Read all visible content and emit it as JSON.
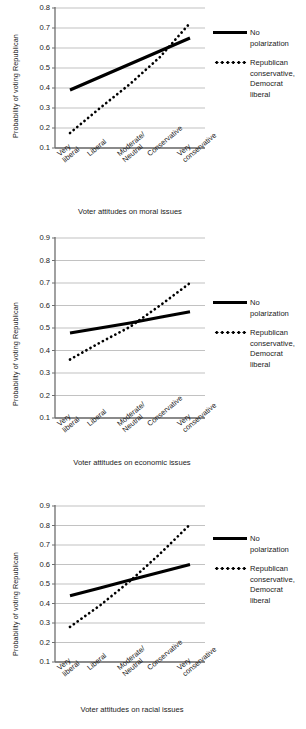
{
  "figure": {
    "series_names": {
      "solid": "No polarization",
      "dotted": "Republican conservative, Democrat liberal"
    },
    "legend": {
      "solid_label": "No polarization",
      "dotted_label": "Republican\nconservative,\nDemocrat\nliberal",
      "solid_key_icon": "solid-line-key-icon",
      "dotted_key_icon": "dotted-line-key-icon"
    },
    "shared": {
      "ylabel": "Probability of voting Republican",
      "categories": [
        "Very\nliberal",
        "Liberal",
        "Moderate/\nNeutral",
        "Conservative",
        "Very\nconservative"
      ]
    },
    "colors": {
      "line": "#000000",
      "grid": "#a8a8a8",
      "axis": "#808080",
      "text": "#1a1a1a",
      "background": "#ffffff"
    }
  },
  "chart_data": [
    {
      "id": "moral-issues",
      "type": "line",
      "title": "",
      "xlabel": "Voter attitudes on moral issues",
      "ylabel": "Probability of voting Republican",
      "categories": [
        "Very liberal",
        "Liberal",
        "Moderate/Neutral",
        "Conservative",
        "Very conservative"
      ],
      "yticks": [
        0.1,
        0.2,
        0.3,
        0.4,
        0.5,
        0.6,
        0.7,
        0.8
      ],
      "ytick_labels": [
        "0.1",
        "0.2",
        "0.3",
        "0.4",
        "0.5",
        "0.6",
        "0.7",
        "0.8"
      ],
      "ylim": [
        0.1,
        0.8
      ],
      "grid": true,
      "legend_position": "right",
      "series": [
        {
          "name": "No polarization",
          "style": "solid",
          "values": [
            0.39,
            0.455,
            0.52,
            0.585,
            0.65
          ]
        },
        {
          "name": "Republican conservative, Democrat liberal",
          "style": "dotted",
          "values": [
            0.175,
            0.3,
            0.42,
            0.555,
            0.725
          ]
        }
      ]
    },
    {
      "id": "economic-issues",
      "type": "line",
      "title": "",
      "xlabel": "Voter attitudes on economic issues",
      "ylabel": "Probability of voting Republican",
      "categories": [
        "Very liberal",
        "Liberal",
        "Moderate/Neutral",
        "Conservative",
        "Very conservative"
      ],
      "yticks": [
        0.1,
        0.2,
        0.3,
        0.4,
        0.5,
        0.6,
        0.7,
        0.8,
        0.9
      ],
      "ytick_labels": [
        "0.1",
        "0.2",
        "0.3",
        "0.4",
        "0.5",
        "0.6",
        "0.7",
        "0.8",
        "0.9"
      ],
      "ylim": [
        0.1,
        0.9
      ],
      "grid": true,
      "legend_position": "right",
      "series": [
        {
          "name": "No polarization",
          "style": "solid",
          "values": [
            0.478,
            0.5,
            0.5225,
            0.5475,
            0.572
          ]
        },
        {
          "name": "Republican conservative, Democrat liberal",
          "style": "dotted",
          "values": [
            0.36,
            0.435,
            0.505,
            0.6,
            0.7
          ]
        }
      ]
    },
    {
      "id": "racial-issues",
      "type": "line",
      "title": "",
      "xlabel": "Voter attitudes on racial issues",
      "ylabel": "Probability of voting Republican",
      "categories": [
        "Very liberal",
        "Liberal",
        "Moderate/Neutral",
        "Conservative",
        "Very conservative"
      ],
      "yticks": [
        0.1,
        0.2,
        0.3,
        0.4,
        0.5,
        0.6,
        0.7,
        0.8,
        0.9
      ],
      "ytick_labels": [
        "0.1",
        "0.2",
        "0.3",
        "0.4",
        "0.5",
        "0.6",
        "0.7",
        "0.8",
        "0.9"
      ],
      "ylim": [
        0.1,
        0.9
      ],
      "grid": true,
      "legend_position": "right",
      "series": [
        {
          "name": "No polarization",
          "style": "solid",
          "values": [
            0.44,
            0.48,
            0.52,
            0.56,
            0.6
          ]
        },
        {
          "name": "Republican conservative, Democrat liberal",
          "style": "dotted",
          "values": [
            0.28,
            0.39,
            0.515,
            0.655,
            0.805
          ]
        }
      ]
    }
  ]
}
